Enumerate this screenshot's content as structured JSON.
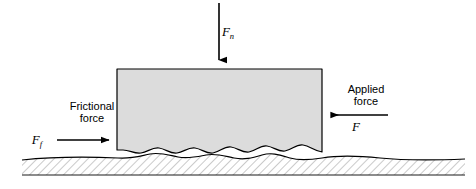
{
  "figure": {
    "background_color": "#ffffff",
    "line_color": "#000000",
    "block_fill_color": "#dcdcdc",
    "ground_fill_color": "#ffffff",
    "hatch_color": "#8c8c8c"
  },
  "labels": {
    "normal_force_symbol": "F",
    "normal_force_subscript": "n",
    "applied_force_line1": "Applied",
    "applied_force_line2": "force",
    "applied_force_symbol": "F",
    "frictional_force_line1": "Frictional",
    "frictional_force_line2": "force",
    "frictional_force_symbol": "F",
    "frictional_force_subscript": "f"
  },
  "forces": [
    {
      "name": "normal-force",
      "symbol": "F",
      "subscript": "n",
      "direction": "down",
      "caption": ""
    },
    {
      "name": "applied-force",
      "symbol": "F",
      "subscript": "",
      "direction": "left",
      "caption": "Applied force"
    },
    {
      "name": "frictional-force",
      "symbol": "F",
      "subscript": "f",
      "direction": "right",
      "caption": "Frictional force"
    }
  ]
}
